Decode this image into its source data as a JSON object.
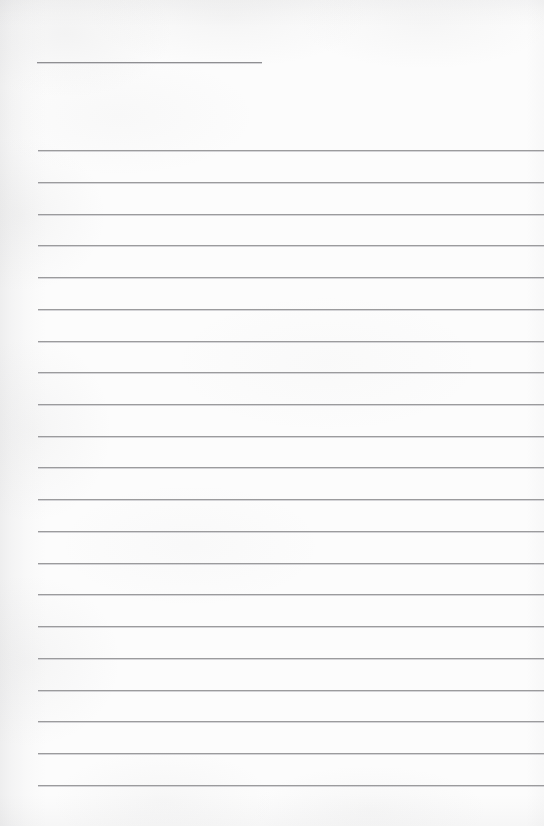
{
  "document": {
    "type": "scanned-blank-ruled-page",
    "title_text": "",
    "body_text": "",
    "page_width": 544,
    "page_height": 826,
    "paper_color": "#fcfcfc",
    "rule_color": "#9b9b9d",
    "rule_highlight_color": "#cdcdd0",
    "left_margin_x": 37,
    "rule_thickness_px": 1,
    "rule_spacing_px": 31.75,
    "header_rule": {
      "label": "header-blank-rule",
      "x": 37,
      "y": 62,
      "width": 225,
      "value": ""
    },
    "rules": [
      {
        "index": 1,
        "y": 150,
        "x": 38,
        "value": ""
      },
      {
        "index": 2,
        "y": 182,
        "x": 38,
        "value": ""
      },
      {
        "index": 3,
        "y": 214,
        "x": 38,
        "value": ""
      },
      {
        "index": 4,
        "y": 245,
        "x": 38,
        "value": ""
      },
      {
        "index": 5,
        "y": 277,
        "x": 38,
        "value": ""
      },
      {
        "index": 6,
        "y": 309,
        "x": 38,
        "value": ""
      },
      {
        "index": 7,
        "y": 341,
        "x": 38,
        "value": ""
      },
      {
        "index": 8,
        "y": 372,
        "x": 38,
        "value": ""
      },
      {
        "index": 9,
        "y": 404,
        "x": 38,
        "value": ""
      },
      {
        "index": 10,
        "y": 436,
        "x": 38,
        "value": ""
      },
      {
        "index": 11,
        "y": 467,
        "x": 38,
        "value": ""
      },
      {
        "index": 12,
        "y": 499,
        "x": 38,
        "value": ""
      },
      {
        "index": 13,
        "y": 531,
        "x": 38,
        "value": ""
      },
      {
        "index": 14,
        "y": 563,
        "x": 38,
        "value": ""
      },
      {
        "index": 15,
        "y": 594,
        "x": 38,
        "value": ""
      },
      {
        "index": 16,
        "y": 626,
        "x": 38,
        "value": ""
      },
      {
        "index": 17,
        "y": 658,
        "x": 38,
        "value": ""
      },
      {
        "index": 18,
        "y": 690,
        "x": 38,
        "value": ""
      },
      {
        "index": 19,
        "y": 721,
        "x": 38,
        "value": ""
      },
      {
        "index": 20,
        "y": 753,
        "x": 38,
        "value": ""
      },
      {
        "index": 21,
        "y": 785,
        "x": 38,
        "value": ""
      }
    ]
  }
}
